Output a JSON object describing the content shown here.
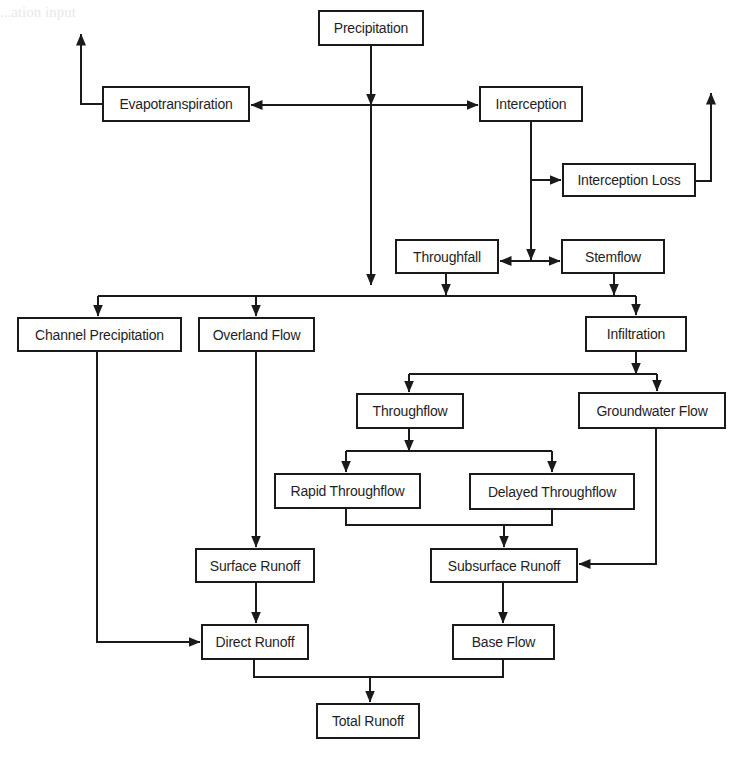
{
  "diagram": {
    "type": "flowchart",
    "header_fragment": "...ation input",
    "nodes": [
      {
        "id": "precipitation",
        "label": "Precipitation",
        "x": 318,
        "y": 10,
        "w": 106,
        "h": 36
      },
      {
        "id": "evapotranspiration",
        "label": "Evapotranspiration",
        "x": 102,
        "y": 86,
        "w": 148,
        "h": 36
      },
      {
        "id": "interception",
        "label": "Interception",
        "x": 479,
        "y": 86,
        "w": 104,
        "h": 36
      },
      {
        "id": "interception_loss",
        "label": "Interception Loss",
        "x": 562,
        "y": 163,
        "w": 134,
        "h": 34
      },
      {
        "id": "throughfall",
        "label": "Throughfall",
        "x": 395,
        "y": 239,
        "w": 104,
        "h": 35
      },
      {
        "id": "stemflow",
        "label": "Stemflow",
        "x": 561,
        "y": 239,
        "w": 104,
        "h": 35
      },
      {
        "id": "channel_precipitation",
        "label": "Channel Precipitation",
        "x": 17,
        "y": 317,
        "w": 165,
        "h": 35
      },
      {
        "id": "overland_flow",
        "label": "Overland Flow",
        "x": 198,
        "y": 317,
        "w": 117,
        "h": 35
      },
      {
        "id": "infiltration",
        "label": "Infiltration",
        "x": 585,
        "y": 316,
        "w": 102,
        "h": 36
      },
      {
        "id": "throughflow",
        "label": "Throughflow",
        "x": 356,
        "y": 393,
        "w": 108,
        "h": 36
      },
      {
        "id": "groundwater_flow",
        "label": "Groundwater Flow",
        "x": 578,
        "y": 392,
        "w": 148,
        "h": 37
      },
      {
        "id": "rapid_throughflow",
        "label": "Rapid Throughflow",
        "x": 274,
        "y": 473,
        "w": 147,
        "h": 36
      },
      {
        "id": "delayed_throughflow",
        "label": "Delayed Throughflow",
        "x": 469,
        "y": 473,
        "w": 166,
        "h": 37
      },
      {
        "id": "surface_runoff",
        "label": "Surface Runoff",
        "x": 195,
        "y": 548,
        "w": 120,
        "h": 35
      },
      {
        "id": "subsurface_runoff",
        "label": "Subsurface Runoff",
        "x": 430,
        "y": 548,
        "w": 148,
        "h": 35
      },
      {
        "id": "direct_runoff",
        "label": "Direct Runoff",
        "x": 201,
        "y": 624,
        "w": 108,
        "h": 36
      },
      {
        "id": "base_flow",
        "label": "Base Flow",
        "x": 452,
        "y": 624,
        "w": 103,
        "h": 36
      },
      {
        "id": "total_runoff",
        "label": "Total Runoff",
        "x": 316,
        "y": 703,
        "w": 104,
        "h": 36
      }
    ],
    "edges": [
      {
        "from": "precipitation",
        "to": "evapotranspiration"
      },
      {
        "from": "precipitation",
        "to": "interception"
      },
      {
        "from": "precipitation",
        "to": "channel_precipitation"
      },
      {
        "from": "precipitation",
        "to": "overland_flow"
      },
      {
        "from": "precipitation",
        "to": "infiltration"
      },
      {
        "from": "evapotranspiration",
        "to": "atmosphere"
      },
      {
        "from": "interception",
        "to": "interception_loss"
      },
      {
        "from": "interception",
        "to": "throughfall"
      },
      {
        "from": "interception",
        "to": "stemflow"
      },
      {
        "from": "interception_loss",
        "to": "atmosphere"
      },
      {
        "from": "throughfall",
        "to": "ground_surface"
      },
      {
        "from": "stemflow",
        "to": "ground_surface"
      },
      {
        "from": "infiltration",
        "to": "throughflow"
      },
      {
        "from": "infiltration",
        "to": "groundwater_flow"
      },
      {
        "from": "throughflow",
        "to": "rapid_throughflow"
      },
      {
        "from": "throughflow",
        "to": "delayed_throughflow"
      },
      {
        "from": "rapid_throughflow",
        "to": "subsurface_runoff"
      },
      {
        "from": "delayed_throughflow",
        "to": "subsurface_runoff"
      },
      {
        "from": "groundwater_flow",
        "to": "subsurface_runoff"
      },
      {
        "from": "overland_flow",
        "to": "surface_runoff"
      },
      {
        "from": "surface_runoff",
        "to": "direct_runoff"
      },
      {
        "from": "channel_precipitation",
        "to": "direct_runoff"
      },
      {
        "from": "subsurface_runoff",
        "to": "base_flow"
      },
      {
        "from": "direct_runoff",
        "to": "total_runoff"
      },
      {
        "from": "base_flow",
        "to": "total_runoff"
      }
    ],
    "colors": {
      "line": "#1a1a1a",
      "box_border": "#1a1a1a",
      "box_fill": "#ffffff",
      "text": "#1f1f1f",
      "background": "#ffffff"
    }
  }
}
